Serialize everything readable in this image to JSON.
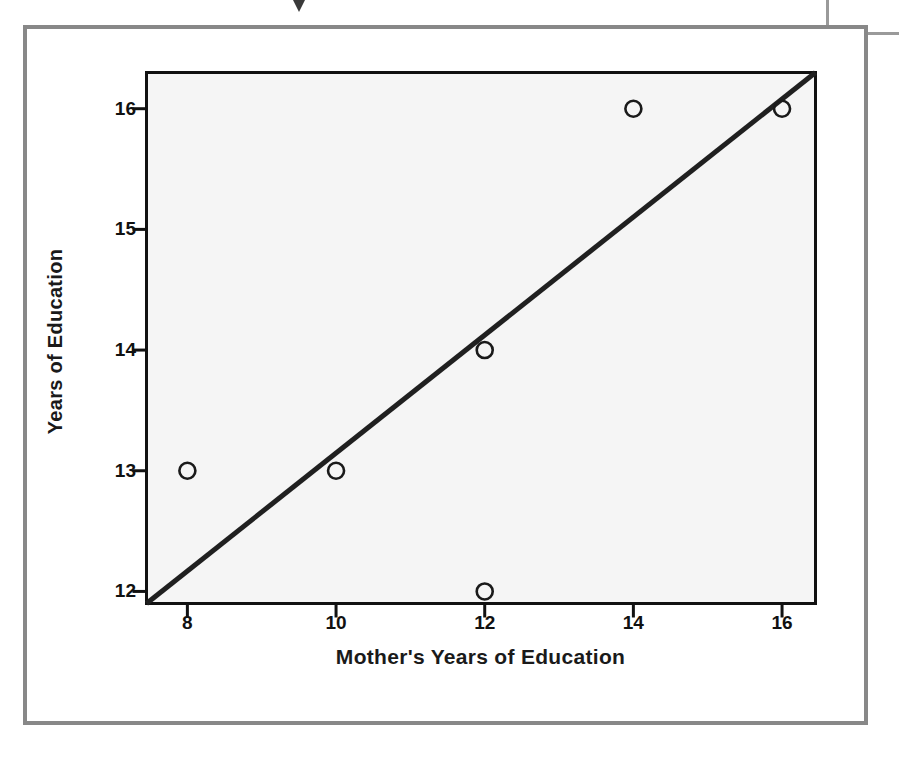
{
  "figure": {
    "bleed_caption": "Education",
    "bleed_marker_icon": "triangle-down-icon"
  },
  "chart_data": {
    "type": "scatter",
    "title": "",
    "xlabel": "Mother's Years of Education",
    "ylabel": "Years of Education",
    "xlim": [
      7.45,
      16.45
    ],
    "ylim": [
      11.9,
      16.3
    ],
    "xticks": [
      8,
      10,
      12,
      14,
      16
    ],
    "yticks": [
      12,
      13,
      14,
      15,
      16
    ],
    "xtick_labels": [
      "8",
      "10",
      "12",
      "14",
      "16"
    ],
    "ytick_labels": [
      "12",
      "13",
      "14",
      "15",
      "16"
    ],
    "grid": false,
    "legend": null,
    "marker_style": "open-circle",
    "points": [
      {
        "x": 8,
        "y": 13
      },
      {
        "x": 10,
        "y": 13
      },
      {
        "x": 12,
        "y": 14
      },
      {
        "x": 12,
        "y": 12
      },
      {
        "x": 14,
        "y": 16
      },
      {
        "x": 16,
        "y": 16
      }
    ],
    "series": [
      {
        "name": "observations",
        "x": [
          8,
          10,
          12,
          12,
          14,
          16
        ],
        "values": [
          13,
          13,
          14,
          12,
          16,
          16
        ]
      }
    ],
    "fit_line": {
      "name": "regression line",
      "x": [
        7.45,
        16.45
      ],
      "y": [
        11.9,
        16.3
      ],
      "slope": 0.489,
      "intercept": 8.256
    },
    "colors": {
      "plot_background": "#f5f5f5",
      "axis": "#111111",
      "line": "#202020",
      "marker": "#1a1a1a",
      "figure_border": "#888888"
    }
  }
}
